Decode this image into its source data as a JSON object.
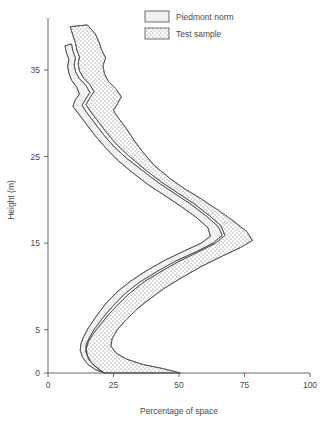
{
  "chart_data": {
    "type": "area",
    "title": "",
    "xlabel": "Percentage of space",
    "ylabel": "Height (m)",
    "xlim": [
      0,
      100
    ],
    "ylim": [
      0,
      41
    ],
    "grid": false,
    "legend_position": "top-center",
    "xticks": [
      0,
      25,
      50,
      75,
      100
    ],
    "xtick_labels": [
      "0",
      "25",
      "50",
      "75",
      "100"
    ],
    "yticks": [
      0,
      5,
      15,
      25,
      35
    ],
    "ytick_labels": [
      "0",
      "5",
      "15",
      "25",
      "35"
    ],
    "series": [
      {
        "name": "Piedmont norm",
        "style": "light-fill-envelope",
        "fill": "#f0f0f0",
        "stroke": "#4b4b4b",
        "lower": [
          [
            21.5,
            0.0
          ],
          [
            18.0,
            0.4
          ],
          [
            15.2,
            1.0
          ],
          [
            13.2,
            1.8
          ],
          [
            12.3,
            2.6
          ],
          [
            12.6,
            3.4
          ],
          [
            13.6,
            4.2
          ],
          [
            15.4,
            5.2
          ],
          [
            18.5,
            6.6
          ],
          [
            22.0,
            8.0
          ],
          [
            26.5,
            9.4
          ],
          [
            31.5,
            10.6
          ],
          [
            37.5,
            11.8
          ],
          [
            44.5,
            13.0
          ],
          [
            52.0,
            14.1
          ],
          [
            58.5,
            15.0
          ],
          [
            62.0,
            15.8
          ],
          [
            61.0,
            16.8
          ],
          [
            56.5,
            18.0
          ],
          [
            50.0,
            19.4
          ],
          [
            44.0,
            20.6
          ],
          [
            38.0,
            21.8
          ],
          [
            32.0,
            23.2
          ],
          [
            26.5,
            24.6
          ],
          [
            22.0,
            26.0
          ],
          [
            18.0,
            27.4
          ],
          [
            14.5,
            28.8
          ],
          [
            11.5,
            30.0
          ],
          [
            9.5,
            30.8
          ],
          [
            10.5,
            31.6
          ],
          [
            12.0,
            32.2
          ],
          [
            11.0,
            33.0
          ],
          [
            9.0,
            33.8
          ],
          [
            8.0,
            34.6
          ],
          [
            7.5,
            35.4
          ],
          [
            8.0,
            36.2
          ],
          [
            7.0,
            37.0
          ],
          [
            6.5,
            37.8
          ]
        ],
        "upper": [
          [
            21.5,
            0.0
          ],
          [
            20.0,
            0.3
          ],
          [
            17.5,
            0.9
          ],
          [
            15.5,
            1.6
          ],
          [
            14.4,
            2.5
          ],
          [
            14.6,
            3.3
          ],
          [
            15.8,
            4.1
          ],
          [
            17.8,
            5.1
          ],
          [
            21.0,
            6.4
          ],
          [
            25.0,
            7.8
          ],
          [
            29.5,
            9.2
          ],
          [
            35.0,
            10.5
          ],
          [
            41.5,
            11.7
          ],
          [
            48.5,
            12.9
          ],
          [
            56.5,
            14.0
          ],
          [
            63.0,
            15.0
          ],
          [
            66.5,
            15.9
          ],
          [
            65.0,
            16.9
          ],
          [
            60.5,
            18.1
          ],
          [
            54.5,
            19.5
          ],
          [
            48.0,
            20.8
          ],
          [
            42.0,
            22.0
          ],
          [
            36.0,
            23.4
          ],
          [
            30.0,
            24.8
          ],
          [
            25.0,
            26.2
          ],
          [
            21.0,
            27.6
          ],
          [
            17.5,
            29.0
          ],
          [
            14.5,
            30.2
          ],
          [
            13.0,
            30.9
          ],
          [
            14.5,
            31.7
          ],
          [
            16.0,
            32.4
          ],
          [
            14.5,
            33.2
          ],
          [
            12.0,
            34.0
          ],
          [
            10.5,
            34.8
          ],
          [
            10.0,
            35.6
          ],
          [
            10.5,
            36.4
          ],
          [
            9.5,
            37.2
          ],
          [
            9.0,
            38.0
          ]
        ]
      },
      {
        "name": "Test sample",
        "style": "stippled-envelope",
        "fill": "stipple",
        "stroke": "#4b4b4b",
        "lower": [
          [
            21.5,
            0.0
          ],
          [
            19.0,
            0.5
          ],
          [
            16.5,
            1.2
          ],
          [
            15.0,
            2.0
          ],
          [
            14.6,
            2.8
          ],
          [
            15.4,
            3.6
          ],
          [
            17.0,
            4.4
          ],
          [
            19.5,
            5.4
          ],
          [
            23.0,
            6.7
          ],
          [
            27.0,
            8.0
          ],
          [
            31.5,
            9.3
          ],
          [
            36.5,
            10.5
          ],
          [
            43.0,
            11.7
          ],
          [
            50.0,
            12.9
          ],
          [
            57.5,
            14.0
          ],
          [
            64.0,
            15.0
          ],
          [
            67.5,
            15.9
          ],
          [
            66.0,
            17.0
          ],
          [
            61.5,
            18.2
          ],
          [
            55.5,
            19.6
          ],
          [
            49.0,
            20.9
          ],
          [
            43.0,
            22.1
          ],
          [
            37.0,
            23.5
          ],
          [
            31.5,
            24.9
          ],
          [
            26.5,
            26.3
          ],
          [
            22.5,
            27.7
          ],
          [
            19.0,
            29.1
          ],
          [
            16.0,
            30.3
          ],
          [
            14.5,
            31.0
          ],
          [
            16.0,
            31.8
          ],
          [
            17.5,
            32.5
          ],
          [
            16.0,
            33.3
          ],
          [
            13.5,
            34.1
          ],
          [
            12.0,
            34.9
          ],
          [
            11.5,
            35.7
          ],
          [
            12.0,
            36.5
          ],
          [
            11.0,
            37.3
          ],
          [
            10.5,
            38.1
          ],
          [
            9.5,
            39.0
          ],
          [
            8.5,
            40.0
          ]
        ],
        "upper": [
          [
            50.5,
            0.0
          ],
          [
            44.0,
            0.5
          ],
          [
            36.0,
            1.0
          ],
          [
            30.0,
            1.6
          ],
          [
            26.0,
            2.3
          ],
          [
            24.0,
            3.1
          ],
          [
            24.5,
            4.0
          ],
          [
            26.5,
            5.0
          ],
          [
            30.0,
            6.2
          ],
          [
            34.0,
            7.4
          ],
          [
            39.0,
            8.6
          ],
          [
            44.5,
            9.8
          ],
          [
            51.0,
            11.0
          ],
          [
            58.5,
            12.3
          ],
          [
            66.5,
            13.5
          ],
          [
            73.5,
            14.5
          ],
          [
            78.0,
            15.3
          ],
          [
            76.0,
            16.3
          ],
          [
            71.0,
            17.5
          ],
          [
            65.0,
            18.8
          ],
          [
            58.5,
            20.1
          ],
          [
            52.0,
            21.3
          ],
          [
            46.0,
            22.6
          ],
          [
            40.5,
            24.0
          ],
          [
            36.5,
            25.4
          ],
          [
            33.0,
            26.8
          ],
          [
            30.0,
            28.2
          ],
          [
            27.0,
            29.4
          ],
          [
            25.0,
            30.3
          ],
          [
            26.5,
            31.1
          ],
          [
            28.0,
            31.9
          ],
          [
            26.0,
            32.8
          ],
          [
            23.0,
            33.7
          ],
          [
            21.5,
            34.6
          ],
          [
            21.0,
            35.5
          ],
          [
            22.0,
            36.4
          ],
          [
            20.5,
            37.3
          ],
          [
            19.5,
            38.2
          ],
          [
            18.0,
            39.2
          ],
          [
            15.0,
            40.2
          ]
        ]
      }
    ]
  },
  "legend": {
    "items": [
      {
        "label": "Piedmont norm",
        "swatch": "light-swatch"
      },
      {
        "label": "Test sample",
        "swatch": "stipple-swatch"
      }
    ]
  },
  "colors": {
    "axis": "#585858",
    "text": "#4a4a4a",
    "band_light_fill": "#f0f0f0",
    "band_outline": "#4b4b4b",
    "stipple_dot": "#555555",
    "overlap_dot": "#333333",
    "background": "#ffffff"
  }
}
